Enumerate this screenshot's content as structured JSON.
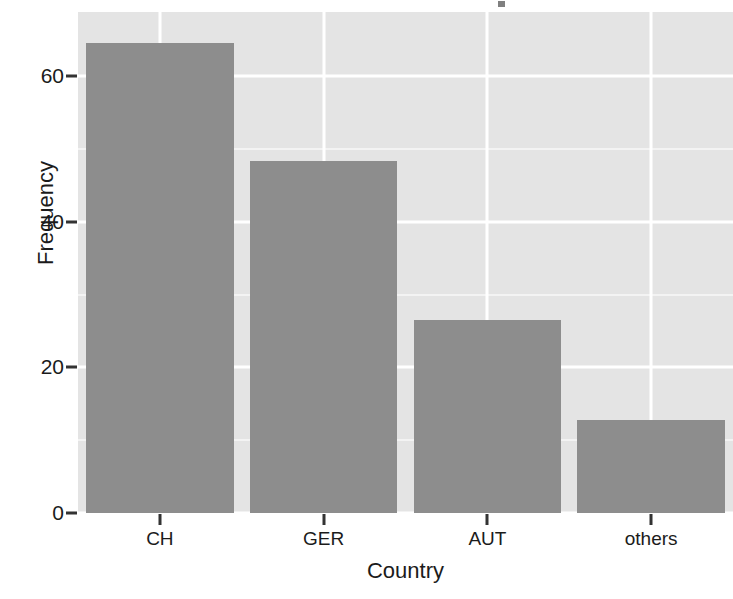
{
  "chart_data": {
    "type": "bar",
    "title": "",
    "xlabel": "Country",
    "ylabel": "Frequency",
    "categories": [
      "CH",
      "GER",
      "AUT",
      "others"
    ],
    "values": [
      64.5,
      48.3,
      26.5,
      12.8
    ],
    "ylim": [
      0,
      68.8
    ],
    "y_ticks": [
      0,
      20,
      40,
      60
    ],
    "y_tick_labels": [
      "0",
      "20",
      "40",
      "60"
    ],
    "y_minor_ticks": [
      10,
      30,
      50
    ],
    "grid": "major and minor horizontal, major vertical at category centers",
    "legend": "none",
    "bar_color": "#8d8d8d",
    "panel_color": "#e4e4e4",
    "gridline_color": "#ffffff",
    "text_color": "#1b1b1b"
  },
  "axes": {
    "y": {
      "title": "Frequency",
      "ticks": [
        {
          "label": "0",
          "value": 0
        },
        {
          "label": "20",
          "value": 20
        },
        {
          "label": "40",
          "value": 40
        },
        {
          "label": "60",
          "value": 60
        }
      ]
    },
    "x": {
      "title": "Country",
      "ticks": [
        {
          "label": "CH"
        },
        {
          "label": "GER"
        },
        {
          "label": "AUT"
        },
        {
          "label": "others"
        }
      ]
    }
  }
}
